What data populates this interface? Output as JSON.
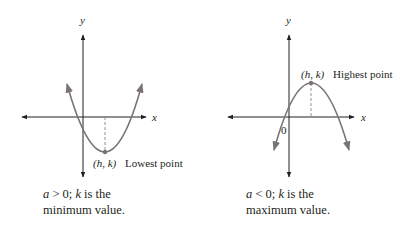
{
  "colors": {
    "axis": "#231f20",
    "curve": "#7a7375",
    "text": "#231f20"
  },
  "diagrams": [
    {
      "id": "upward-parabola",
      "axis_labels": {
        "x": "x",
        "y": "y"
      },
      "vertex_label": "(h, k)",
      "vertex_description": "Lowest point",
      "caption": {
        "line1_a": "a",
        "line1_rel": " > 0; ",
        "line1_k": "k",
        "line1_rest": " is the",
        "line2": "minimum value."
      }
    },
    {
      "id": "downward-parabola",
      "axis_labels": {
        "x": "x",
        "y": "y"
      },
      "origin_label": "0",
      "vertex_label": "(h, k)",
      "vertex_description": "Highest point",
      "caption": {
        "line1_a": "a",
        "line1_rel": " < 0; ",
        "line1_k": "k",
        "line1_rest": " is the",
        "line2": "maximum value."
      }
    }
  ]
}
